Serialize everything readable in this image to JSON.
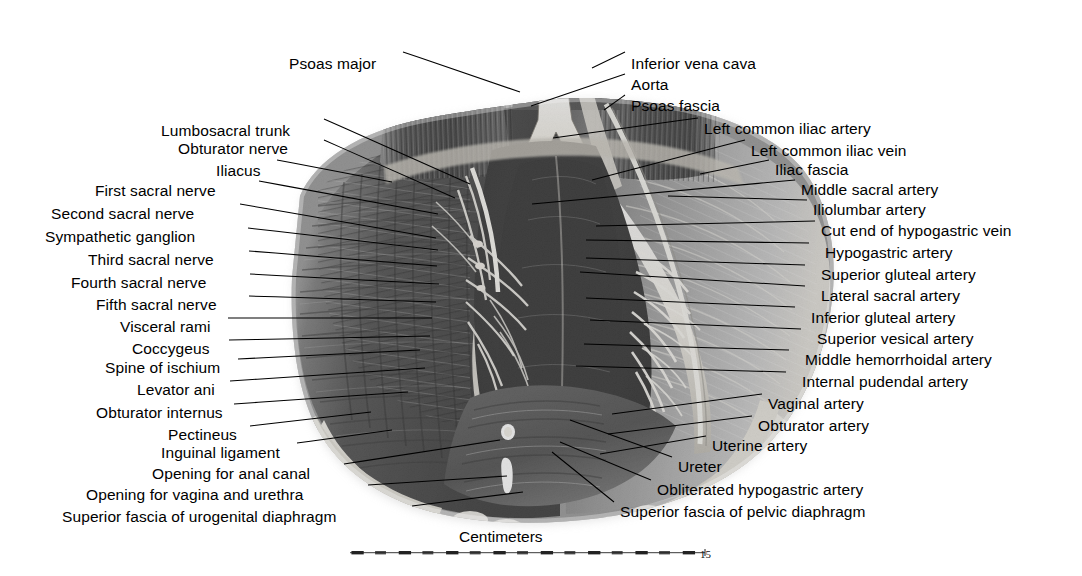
{
  "figure": {
    "kind": "anatomical-illustration",
    "rendering": "halftone grayscale photograph of a dissection"
  },
  "labels_left": [
    {
      "text": "Psoas major",
      "x": 289,
      "y": 56,
      "lx": 403,
      "ly": 52,
      "tx": 520,
      "ty": 92
    },
    {
      "text": "Lumbosacral trunk",
      "x": 161,
      "y": 123,
      "lx": 324,
      "ly": 119,
      "tx": 470,
      "ty": 184
    },
    {
      "text": "Obturator nerve",
      "x": 178,
      "y": 141,
      "lx": 324,
      "ly": 140,
      "tx": 455,
      "ty": 198
    },
    {
      "text": "Iliacus",
      "x": 216,
      "y": 163,
      "lx": 277,
      "ly": 160,
      "tx": 392,
      "ty": 182
    },
    {
      "text": "First sacral nerve",
      "x": 95,
      "y": 183,
      "lx": 259,
      "ly": 181,
      "tx": 438,
      "ty": 214
    },
    {
      "text": "Second sacral nerve",
      "x": 51,
      "y": 206,
      "lx": 240,
      "ly": 204,
      "tx": 436,
      "ty": 238
    },
    {
      "text": "Sympathetic ganglion",
      "x": 45,
      "y": 229,
      "lx": 248,
      "ly": 228,
      "tx": 438,
      "ty": 250
    },
    {
      "text": "Third sacral nerve",
      "x": 88,
      "y": 252,
      "lx": 249,
      "ly": 251,
      "tx": 437,
      "ty": 266
    },
    {
      "text": "Fourth sacral nerve",
      "x": 71,
      "y": 275,
      "lx": 250,
      "ly": 274,
      "tx": 439,
      "ty": 284
    },
    {
      "text": "Fifth sacral nerve",
      "x": 96,
      "y": 297,
      "lx": 249,
      "ly": 296,
      "tx": 436,
      "ty": 302
    },
    {
      "text": "Visceral rami",
      "x": 120,
      "y": 319,
      "lx": 228,
      "ly": 318,
      "tx": 432,
      "ty": 318
    },
    {
      "text": "Coccygeus",
      "x": 132,
      "y": 341,
      "lx": 229,
      "ly": 340,
      "tx": 430,
      "ty": 336
    },
    {
      "text": "Spine of ischium",
      "x": 105,
      "y": 360,
      "lx": 238,
      "ly": 359,
      "tx": 420,
      "ty": 350
    },
    {
      "text": "Levator ani",
      "x": 137,
      "y": 382,
      "lx": 230,
      "ly": 381,
      "tx": 425,
      "ty": 368
    },
    {
      "text": "Obturator internus",
      "x": 96,
      "y": 405,
      "lx": 234,
      "ly": 404,
      "tx": 408,
      "ty": 392
    },
    {
      "text": "Pectineus",
      "x": 168,
      "y": 427,
      "lx": 250,
      "ly": 426,
      "tx": 371,
      "ty": 412
    },
    {
      "text": "Inguinal ligament",
      "x": 161,
      "y": 445,
      "lx": 297,
      "ly": 443,
      "tx": 392,
      "ty": 430
    },
    {
      "text": "Opening for anal canal",
      "x": 152,
      "y": 466,
      "lx": 344,
      "ly": 464,
      "tx": 500,
      "ty": 440
    },
    {
      "text": "Opening for vagina and urethra",
      "x": 86,
      "y": 487,
      "lx": 368,
      "ly": 485,
      "tx": 507,
      "ty": 476
    },
    {
      "text": "Superior fascia of urogenital diaphragm",
      "x": 62,
      "y": 509,
      "lx": 412,
      "ly": 506,
      "tx": 523,
      "ty": 492
    }
  ],
  "labels_right": [
    {
      "text": "Inferior vena cava",
      "x": 631,
      "y": 56,
      "lx": 625,
      "ly": 52,
      "tx": 592,
      "ty": 68
    },
    {
      "text": "Aorta",
      "x": 631,
      "y": 77,
      "lx": 625,
      "ly": 74,
      "tx": 531,
      "ty": 106
    },
    {
      "text": "Psoas fascia",
      "x": 631,
      "y": 98,
      "lx": 625,
      "ly": 95,
      "tx": 604,
      "ty": 110
    },
    {
      "text": "Left common iliac artery",
      "x": 704,
      "y": 121,
      "lx": 698,
      "ly": 118,
      "tx": 553,
      "ty": 138
    },
    {
      "text": "Left common iliac vein",
      "x": 751,
      "y": 143,
      "lx": 745,
      "ly": 140,
      "tx": 592,
      "ty": 180
    },
    {
      "text": "Iliac fascia",
      "x": 775,
      "y": 162,
      "lx": 769,
      "ly": 160,
      "tx": 700,
      "ty": 174
    },
    {
      "text": "Middle sacral artery",
      "x": 801,
      "y": 182,
      "lx": 795,
      "ly": 180,
      "tx": 532,
      "ty": 204
    },
    {
      "text": "Iliolumbar artery",
      "x": 813,
      "y": 202,
      "lx": 807,
      "ly": 200,
      "tx": 668,
      "ty": 196
    },
    {
      "text": "Cut end of hypogastric vein",
      "x": 821,
      "y": 223,
      "lx": 815,
      "ly": 221,
      "tx": 596,
      "ty": 226
    },
    {
      "text": "Hypogastric artery",
      "x": 825,
      "y": 245,
      "lx": 809,
      "ly": 243,
      "tx": 586,
      "ty": 240
    },
    {
      "text": "Superior gluteal artery",
      "x": 821,
      "y": 267,
      "lx": 805,
      "ly": 265,
      "tx": 586,
      "ty": 258
    },
    {
      "text": "Lateral sacral artery",
      "x": 821,
      "y": 288,
      "lx": 805,
      "ly": 286,
      "tx": 580,
      "ty": 272
    },
    {
      "text": "Inferior gluteal artery",
      "x": 811,
      "y": 310,
      "lx": 795,
      "ly": 307,
      "tx": 586,
      "ty": 298
    },
    {
      "text": "Superior vesical artery",
      "x": 817,
      "y": 331,
      "lx": 801,
      "ly": 329,
      "tx": 590,
      "ty": 320
    },
    {
      "text": "Middle hemorrhoidal artery",
      "x": 805,
      "y": 352,
      "lx": 789,
      "ly": 350,
      "tx": 584,
      "ty": 344
    },
    {
      "text": "Internal pudendal artery",
      "x": 802,
      "y": 374,
      "lx": 786,
      "ly": 372,
      "tx": 576,
      "ty": 366
    },
    {
      "text": "Vaginal artery",
      "x": 768,
      "y": 396,
      "lx": 762,
      "ly": 394,
      "tx": 612,
      "ty": 414
    },
    {
      "text": "Obturator artery",
      "x": 758,
      "y": 418,
      "lx": 752,
      "ly": 416,
      "tx": 608,
      "ty": 434
    },
    {
      "text": "Uterine artery",
      "x": 712,
      "y": 438,
      "lx": 706,
      "ly": 436,
      "tx": 600,
      "ty": 454
    },
    {
      "text": "Ureter",
      "x": 678,
      "y": 459,
      "lx": 672,
      "ly": 457,
      "tx": 570,
      "ty": 420
    },
    {
      "text": "Obliterated hypogastric artery",
      "x": 657,
      "y": 482,
      "lx": 651,
      "ly": 480,
      "tx": 560,
      "ty": 442
    },
    {
      "text": "Superior fascia of pelvic diaphragm",
      "x": 620,
      "y": 504,
      "lx": 614,
      "ly": 502,
      "tx": 552,
      "ty": 452
    }
  ],
  "scale": {
    "caption": "Centimeters",
    "caption_x": 459,
    "caption_y": 528,
    "end_value": "15",
    "end_value_x": 700,
    "end_value_y": 548,
    "bar_x": 350,
    "bar_y": 551,
    "bar_width": 355,
    "divisions": 15
  },
  "colors": {
    "ink": "#000000",
    "background": "#ffffff",
    "tissue_dark": "#2b2b2b",
    "tissue_mid": "#6e6e6e",
    "tissue_light": "#b9b9b9",
    "bone_pale": "#e6e3dc",
    "vessel_white": "#f2f0ea"
  }
}
